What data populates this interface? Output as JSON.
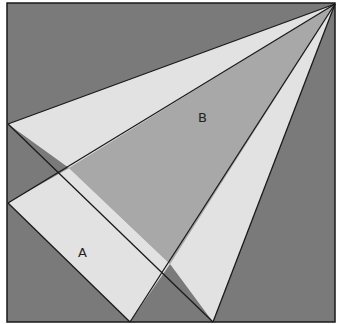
{
  "diagram": {
    "type": "geometric-dissection",
    "colors": {
      "background_dark": "#7a7a7a",
      "region_light": "#e2e2e2",
      "region_medium": "#a8a8a8",
      "stroke": "#1a1a1a"
    },
    "labels": {
      "a": "A",
      "b": "B"
    }
  }
}
